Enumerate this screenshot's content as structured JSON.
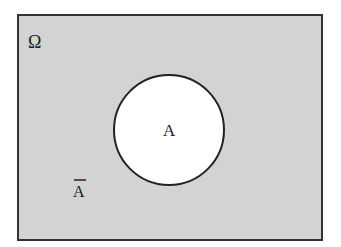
{
  "diagram": {
    "type": "venn",
    "universe": {
      "label": "Ω",
      "fill": "#d3d3d3",
      "stroke": "#333333"
    },
    "set": {
      "label": "A",
      "fill": "#ffffff",
      "stroke": "#222222"
    },
    "complement": {
      "label": "A",
      "overline": true
    }
  }
}
